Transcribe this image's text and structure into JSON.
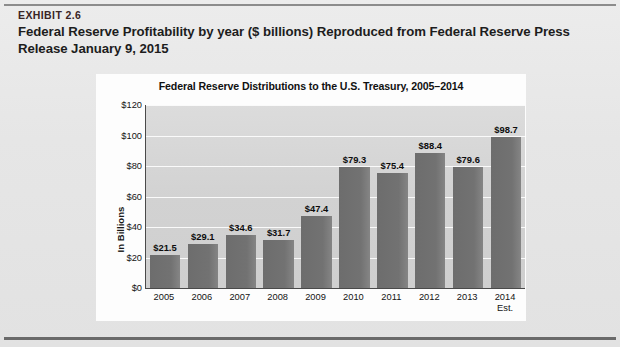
{
  "exhibit": {
    "number": "EXHIBIT 2.6",
    "title": "Federal Reserve Profitability by year ($ billions) Reproduced from Federal Reserve Press Release January 9, 2015"
  },
  "chart_data": {
    "type": "bar",
    "title": "Federal Reserve Distributions to the U.S. Treasury, 2005–2014",
    "xlabel": "",
    "ylabel": "In Billions",
    "ylim": [
      0,
      120
    ],
    "ytick_labels": [
      "$120",
      "$100",
      "$80",
      "$60",
      "$40",
      "$20",
      "$0"
    ],
    "ytick_values": [
      120,
      100,
      80,
      60,
      40,
      20,
      0
    ],
    "grid": true,
    "legend": "none",
    "categories": [
      "2005",
      "2006",
      "2007",
      "2008",
      "2009",
      "2010",
      "2011",
      "2012",
      "2013",
      "2014 Est."
    ],
    "category_lines": [
      [
        "2005"
      ],
      [
        "2006"
      ],
      [
        "2007"
      ],
      [
        "2008"
      ],
      [
        "2009"
      ],
      [
        "2010"
      ],
      [
        "2011"
      ],
      [
        "2012"
      ],
      [
        "2013"
      ],
      [
        "2014",
        "Est."
      ]
    ],
    "values": [
      21.5,
      29.1,
      34.6,
      31.7,
      47.4,
      79.3,
      75.4,
      88.4,
      79.6,
      98.7
    ],
    "data_labels": [
      "$21.5",
      "$29.1",
      "$34.6",
      "$31.7",
      "$47.4",
      "$79.3",
      "$75.4",
      "$88.4",
      "$79.6",
      "$98.7"
    ],
    "bar_color": "#6f6f6f",
    "plot_background": "#d4d4d4",
    "gridline_color": "#fafafa"
  }
}
